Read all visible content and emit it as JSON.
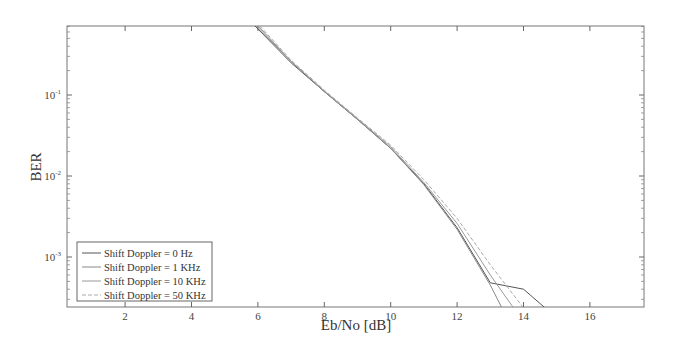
{
  "chart_data": {
    "type": "line",
    "title": "",
    "xlabel": "Eb/No [dB]",
    "ylabel": "BER",
    "xscale": "linear",
    "yscale": "log",
    "xlim": [
      0.25,
      17.6
    ],
    "ylim": [
      0.000235,
      0.71
    ],
    "grid": false,
    "legend_position": "lower left",
    "x_ticks": [
      2,
      4,
      6,
      8,
      10,
      12,
      14,
      16
    ],
    "x_tick_labels": [
      "2",
      "4",
      "6",
      "8",
      "10",
      "12",
      "14",
      "16"
    ],
    "y_ticks": [
      0.1,
      0.01,
      0.001
    ],
    "y_tick_labels": [
      "10^-1",
      "10^-2",
      "10^-3"
    ],
    "series": [
      {
        "name": "Shift Doppler = 0 Hz",
        "color": "#555555",
        "dash": "solid",
        "x": [
          5.9,
          7,
          8,
          9,
          10,
          11,
          12,
          13,
          14,
          14.65
        ],
        "y": [
          0.72,
          0.25,
          0.11,
          0.05,
          0.022,
          0.008,
          0.0023,
          0.00048,
          0.0004,
          0.000235
        ]
      },
      {
        "name": "Shift Doppler = 1 KHz",
        "color": "#888888",
        "dash": "solid",
        "x": [
          5.95,
          7,
          8,
          9,
          10,
          11,
          12,
          13,
          13.35
        ],
        "y": [
          0.72,
          0.26,
          0.11,
          0.05,
          0.022,
          0.0078,
          0.0022,
          0.00045,
          0.000235
        ]
      },
      {
        "name": "Shift Doppler = 10 KHz",
        "color": "#999999",
        "dash": "solid",
        "x": [
          6.0,
          7,
          8,
          9,
          10,
          11,
          12,
          13,
          13.7
        ],
        "y": [
          0.72,
          0.26,
          0.112,
          0.051,
          0.023,
          0.0083,
          0.0026,
          0.0006,
          0.000235
        ]
      },
      {
        "name": "Shift Doppler = 50 KHz",
        "color": "#aaaaaa",
        "dash": "dashed",
        "x": [
          6.05,
          7,
          8,
          9,
          10,
          11,
          12,
          13,
          14.0
        ],
        "y": [
          0.72,
          0.27,
          0.115,
          0.052,
          0.024,
          0.009,
          0.003,
          0.0008,
          0.000235
        ]
      }
    ]
  },
  "legend": {
    "items": [
      "Shift Doppler = 0 Hz",
      "Shift Doppler = 1 KHz",
      "Shift Doppler = 10 KHz",
      "Shift Doppler = 50 KHz"
    ]
  },
  "axes": {
    "xlabel": "Eb/No [dB]",
    "ylabel": "BER",
    "x_tick_labels": [
      "2",
      "4",
      "6",
      "8",
      "10",
      "12",
      "14",
      "16"
    ],
    "y_tick_base": "10",
    "y_tick_exponents": [
      "-1",
      "-2",
      "-3"
    ]
  }
}
